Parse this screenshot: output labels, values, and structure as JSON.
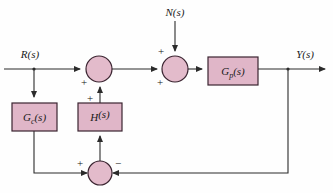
{
  "diagram": {
    "colors": {
      "block_fill": "#e0b6c8",
      "block_stroke": "#3a2430",
      "summer_fill": "#e3bbcb",
      "wire": "#2b2b2b",
      "background": "#fefefe",
      "text": "#1a1a1a"
    },
    "signals": [
      {
        "id": "input-r",
        "label": "R(s)",
        "x": 30,
        "y": 56
      },
      {
        "id": "input-n",
        "label": "N(s)",
        "x": 175,
        "y": 15
      },
      {
        "id": "output-y",
        "label": "Y(s)",
        "x": 305,
        "y": 56
      }
    ],
    "blocks": [
      {
        "id": "controller",
        "base": "G",
        "sub": "c",
        "arg": "(s)",
        "label": "G_c(s)",
        "x": 12,
        "y": 103,
        "w": 45,
        "h": 28
      },
      {
        "id": "feedback-h",
        "base": "H",
        "sub": "",
        "arg": "(s)",
        "label": "H(s)",
        "x": 78,
        "y": 103,
        "w": 44,
        "h": 28
      },
      {
        "id": "plant",
        "base": "G",
        "sub": "p",
        "arg": "(s)",
        "label": "G_p(s)",
        "x": 208,
        "y": 57,
        "w": 50,
        "h": 28
      }
    ],
    "summers": [
      {
        "id": "summer-1",
        "cx": 99,
        "cy": 69,
        "r": 13,
        "signs": [
          {
            "symbol": "+",
            "x": 84,
            "y": 86,
            "input": "from-r"
          },
          {
            "symbol": "+",
            "x": 90,
            "y": 102,
            "input": "from-h"
          }
        ]
      },
      {
        "id": "summer-2",
        "cx": 175,
        "cy": 69,
        "r": 13,
        "signs": [
          {
            "symbol": "+",
            "x": 160,
            "y": 86,
            "input": "from-summer-1"
          },
          {
            "symbol": "+",
            "x": 161,
            "y": 55,
            "input": "from-n"
          }
        ]
      },
      {
        "id": "summer-3",
        "cx": 100,
        "cy": 173,
        "r": 12,
        "signs": [
          {
            "symbol": "+",
            "x": 80,
            "y": 166,
            "input": "from-gc"
          },
          {
            "symbol": "−",
            "x": 117,
            "y": 166,
            "input": "from-y"
          }
        ]
      }
    ]
  }
}
